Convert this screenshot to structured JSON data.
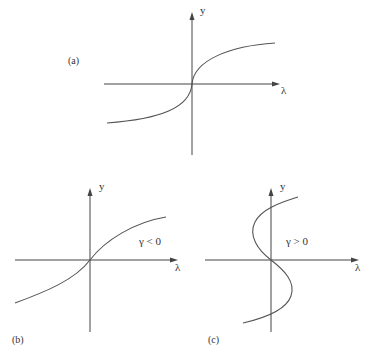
{
  "figure": {
    "panels": [
      {
        "id": "a",
        "label": "(a)",
        "x_axis_label": "λ",
        "y_axis_label": "y",
        "annotation": "",
        "curve_description": "monotonically increasing, vertical tangent at origin, saturating for large |λ|"
      },
      {
        "id": "b",
        "label": "(b)",
        "x_axis_label": "λ",
        "y_axis_label": "y",
        "annotation": "γ < 0",
        "curve_description": "smooth monotonically increasing curve through origin"
      },
      {
        "id": "c",
        "label": "(c)",
        "x_axis_label": "λ",
        "y_axis_label": "y",
        "annotation": "γ > 0",
        "curve_description": "S-shaped multivalued curve through origin (folds back)"
      }
    ]
  }
}
